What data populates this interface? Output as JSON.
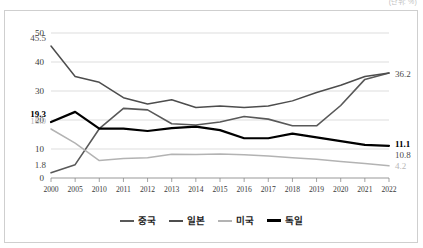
{
  "unit_caption": "(단위: %)",
  "chart_data": {
    "type": "line",
    "title": "",
    "subtitle": "",
    "xlabel": "",
    "ylabel": "",
    "unit": "%",
    "grid": true,
    "legend_position": "bottom",
    "ylim": [
      0,
      50
    ],
    "yticks": [
      "0",
      "10",
      "20",
      "30",
      "40",
      "50"
    ],
    "categories": [
      "2000",
      "2005",
      "2010",
      "2011",
      "2012",
      "2013",
      "2014",
      "2015",
      "2016",
      "2017",
      "2018",
      "2019",
      "2020",
      "2021",
      "2022"
    ],
    "series": [
      {
        "name": "중국",
        "key": "cn",
        "color": "#595959",
        "values": [
          1.8,
          4.6,
          17.0,
          24.0,
          23.5,
          18.7,
          18.3,
          19.3,
          21.2,
          20.3,
          18.0,
          18.0,
          25.0,
          34.0,
          36.2
        ],
        "start_label": "1.8",
        "end_label": "36.2"
      },
      {
        "name": "일본",
        "key": "jp",
        "color": "#4d4d4d",
        "values": [
          45.5,
          35.0,
          33.0,
          27.7,
          25.5,
          27.0,
          24.3,
          24.8,
          24.3,
          24.8,
          26.6,
          29.5,
          32.0,
          35.0,
          36.2
        ],
        "start_label": "45.5",
        "end_label": "10.8"
      },
      {
        "name": "미국",
        "key": "us",
        "color": "#b3b3b3",
        "values": [
          16.9,
          12.0,
          6.0,
          6.7,
          7.0,
          8.2,
          8.1,
          8.3,
          8.0,
          7.6,
          7.0,
          6.5,
          5.7,
          5.0,
          4.2
        ],
        "start_label": "16.9",
        "end_label": "4.2"
      },
      {
        "name": "독일",
        "key": "de",
        "color": "#000000",
        "values": [
          19.3,
          22.8,
          17.0,
          17.0,
          16.2,
          17.2,
          17.7,
          16.5,
          13.7,
          13.7,
          15.3,
          14.0,
          12.7,
          11.4,
          11.1
        ],
        "start_label": "19.3",
        "end_label": "11.1"
      }
    ],
    "value_labels": {
      "left": [
        {
          "series": "일본",
          "text": "45.5"
        },
        {
          "series": "독일",
          "text": "19.3"
        },
        {
          "series": "미국",
          "text": "16.9"
        },
        {
          "series": "중국",
          "text": "1.8"
        }
      ],
      "right": [
        {
          "series": "중국",
          "text": "36.2"
        },
        {
          "series": "독일",
          "text": "11.1"
        },
        {
          "series": "일본",
          "text": "10.8"
        },
        {
          "series": "미국",
          "text": "4.2"
        }
      ]
    }
  },
  "legend": {
    "items": [
      {
        "label": "중국",
        "key": "cn"
      },
      {
        "label": "일본",
        "key": "jp"
      },
      {
        "label": "미국",
        "key": "us"
      },
      {
        "label": "독일",
        "key": "de"
      }
    ]
  }
}
